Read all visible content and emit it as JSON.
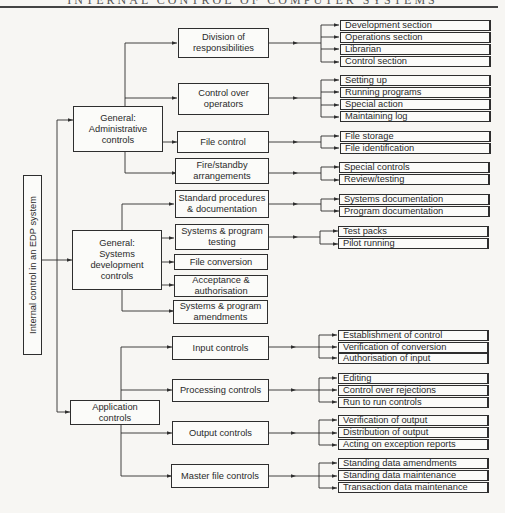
{
  "header": {
    "text": "INTERNAL CONTROL OF COMPUTER SYSTEMS"
  },
  "root": {
    "label": "Internal control in an EDP system"
  },
  "groups": [
    {
      "label": "General:\nAdministrative\ncontrols",
      "children": [
        {
          "label": "Division of\nresponsibilities",
          "items": [
            "Development section",
            "Operations section",
            "Librarian",
            "Control section"
          ]
        },
        {
          "label": "Control over\noperators",
          "items": [
            "Setting up",
            "Running programs",
            "Special action",
            "Maintaining log"
          ]
        },
        {
          "label": "File control",
          "items": [
            "File storage",
            "File identification"
          ]
        },
        {
          "label": "Fire/standby\narrangements",
          "items": [
            "Special controls",
            "Review/testing"
          ]
        }
      ]
    },
    {
      "label": "General:\nSystems\ndevelopment\ncontrols",
      "children": [
        {
          "label": "Standard procedures\n& documentation",
          "items": [
            "Systems documentation",
            "Program documentation"
          ]
        },
        {
          "label": "Systems & program\ntesting",
          "items": [
            "Test packs",
            "Pilot running"
          ]
        },
        {
          "label": "File conversion",
          "items": []
        },
        {
          "label": "Acceptance &\nauthorisation",
          "items": []
        },
        {
          "label": "Systems & program\namendments",
          "items": []
        }
      ]
    },
    {
      "label": "Application\ncontrols",
      "children": [
        {
          "label": "Input controls",
          "items": [
            "Establishment of control",
            "Verification of conversion",
            "Authorisation of input"
          ]
        },
        {
          "label": "Processing controls",
          "items": [
            "Editing",
            "Control over rejections",
            "Run to run controls"
          ]
        },
        {
          "label": "Output controls",
          "items": [
            "Verification of output",
            "Distribution of output",
            "Acting on exception reports"
          ]
        },
        {
          "label": "Master file controls",
          "items": [
            "Standing data amendments",
            "Standing data maintenance",
            "Transaction data maintenance"
          ]
        }
      ]
    }
  ]
}
